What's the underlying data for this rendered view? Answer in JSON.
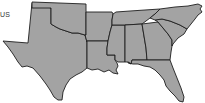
{
  "map": {
    "label": "US",
    "region": "Southern United States",
    "fill_color": "#a3a3a3",
    "border_color": "#1e1e1e",
    "background_color": "#ffffff",
    "states": [
      {
        "name": "Texas"
      },
      {
        "name": "Oklahoma"
      },
      {
        "name": "Arkansas"
      },
      {
        "name": "Louisiana"
      },
      {
        "name": "Mississippi"
      },
      {
        "name": "Alabama"
      },
      {
        "name": "Tennessee"
      },
      {
        "name": "Georgia"
      },
      {
        "name": "Florida"
      },
      {
        "name": "South Carolina"
      },
      {
        "name": "North Carolina"
      }
    ]
  }
}
